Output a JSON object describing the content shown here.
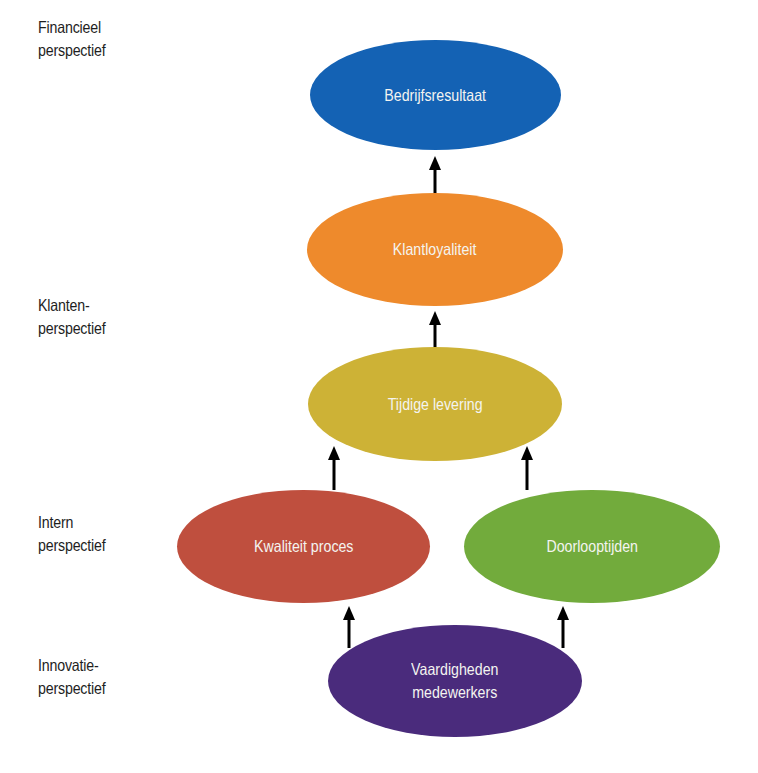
{
  "perspectives": [
    {
      "line1": "Financieel",
      "line2": "perspectief"
    },
    {
      "line1": "Klanten-",
      "line2": "perspectief"
    },
    {
      "line1": "Intern",
      "line2": "perspectief"
    },
    {
      "line1": "Innovatie-",
      "line2": "perspectief"
    }
  ],
  "nodes": {
    "bedrijfsresultaat": {
      "line1": "Bedrijfsresultaat",
      "color": "#1462b4"
    },
    "klantloyaliteit": {
      "line1": "Klantloyaliteit",
      "color": "#ee8a2c"
    },
    "tijdige_levering": {
      "line1": "Tijdige levering",
      "color": "#cdb236"
    },
    "kwaliteit_proces": {
      "line1": "Kwaliteit proces",
      "color": "#bf4f3e"
    },
    "doorlooptijden": {
      "line1": "Doorlooptijden",
      "color": "#72ab3c"
    },
    "vaardigheden": {
      "line1": "Vaardigheden",
      "line2": "medewerkers",
      "color": "#4a2b7c"
    }
  },
  "edges": [
    {
      "from": "Klantloyaliteit",
      "to": "Bedrijfsresultaat"
    },
    {
      "from": "Tijdige levering",
      "to": "Klantloyaliteit"
    },
    {
      "from": "Kwaliteit proces",
      "to": "Tijdige levering"
    },
    {
      "from": "Doorlooptijden",
      "to": "Tijdige levering"
    },
    {
      "from": "Vaardigheden medewerkers",
      "to": "Kwaliteit proces"
    },
    {
      "from": "Vaardigheden medewerkers",
      "to": "Doorlooptijden"
    }
  ]
}
